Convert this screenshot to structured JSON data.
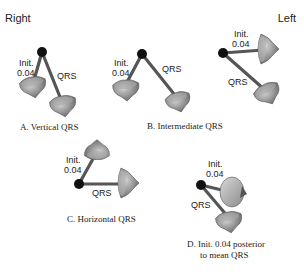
{
  "header": {
    "right_label": "Right",
    "left_label": "Left"
  },
  "panels": [
    {
      "id": "A",
      "caption_line1": "A. Vertical QRS",
      "caption_line2": "",
      "init_label_line1": "Init.",
      "init_label_line2": "0.04",
      "qrs_label": "QRS"
    },
    {
      "id": "B",
      "caption_line1": "B. Intermediate QRS",
      "caption_line2": "",
      "init_label_line1": "Init.",
      "init_label_line2": "0.04",
      "qrs_label": "QRS"
    },
    {
      "id": "B2",
      "caption_line1": "",
      "caption_line2": "",
      "init_label_line1": "Init.",
      "init_label_line2": "0.04",
      "qrs_label": "QRS"
    },
    {
      "id": "C",
      "caption_line1": "C. Horizontal QRS",
      "caption_line2": "",
      "init_label_line1": "Init.",
      "init_label_line2": "0.04",
      "qrs_label": "QRS"
    },
    {
      "id": "D",
      "caption_line1": "D. Init. 0.04 posterior",
      "caption_line2": "to mean QRS",
      "init_label_line1": "Init.",
      "init_label_line2": "0.04",
      "qrs_label": "QRS"
    }
  ],
  "colors": {
    "rod": "#555555",
    "cone": "#8a8a8a",
    "cone_light": "#bdbdbd",
    "origin": "#111111",
    "text": "#222222"
  }
}
